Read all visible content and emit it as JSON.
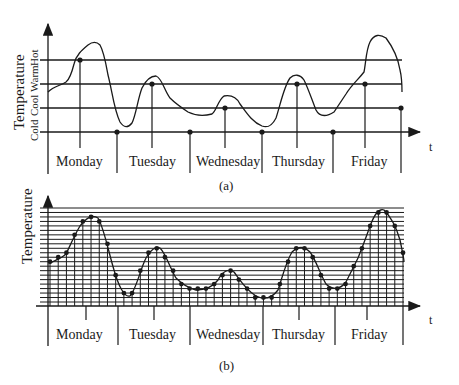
{
  "figure_a": {
    "caption": "(a)",
    "y_axis_label": "Temperature",
    "level_labels": [
      "Cold",
      "Cool",
      "Warm",
      "Hot"
    ],
    "x_axis_label": "t",
    "days": [
      "Monday",
      "Tuesday",
      "Wednesday",
      "Thursday",
      "Friday"
    ],
    "samples": [
      {
        "day": "Monday",
        "level": "Hot"
      },
      {
        "day": "Monday/Tuesday",
        "level": "Cold"
      },
      {
        "day": "Tuesday",
        "level": "Warm"
      },
      {
        "day": "Tuesday/Wednesday",
        "level": "Cold"
      },
      {
        "day": "Wednesday",
        "level": "Cool"
      },
      {
        "day": "Wednesday/Thursday",
        "level": "Cold"
      },
      {
        "day": "Thursday",
        "level": "Warm"
      },
      {
        "day": "Thursday/Friday",
        "level": "Cold"
      },
      {
        "day": "Friday",
        "level": "Warm"
      },
      {
        "day": "Friday end",
        "level": "Cool"
      }
    ]
  },
  "figure_b": {
    "caption": "(b)",
    "y_axis_label": "Temperature",
    "x_axis_label": "t",
    "days": [
      "Monday",
      "Tuesday",
      "Wednesday",
      "Thursday",
      "Friday"
    ],
    "quantization_levels": 22,
    "sample_count": 44
  }
}
